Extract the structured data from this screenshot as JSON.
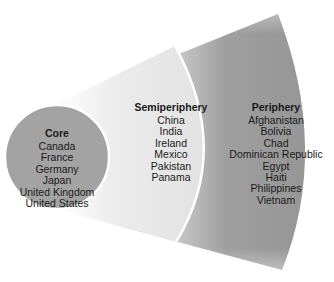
{
  "diagram": {
    "type": "world-systems-nested-zones",
    "colors": {
      "core_fill": "#a3a3a3",
      "semiperiphery_fill": "#e6e6e6",
      "periphery_fill": "#9b9b9b",
      "separator": "#ffffff",
      "text": "#1a1a1a"
    },
    "zones": [
      {
        "title": "Core",
        "countries": [
          "Canada",
          "France",
          "Germany",
          "Japan",
          "United Kingdom",
          "United States"
        ]
      },
      {
        "title": "Semiperiphery",
        "countries": [
          "China",
          "India",
          "Ireland",
          "Mexico",
          "Pakistan",
          "Panama"
        ]
      },
      {
        "title": "Periphery",
        "countries": [
          "Afghanistan",
          "Bolivia",
          "Chad",
          "Dominican Republic",
          "Egypt",
          "Haiti",
          "Philippines",
          "Vietnam"
        ]
      }
    ]
  }
}
